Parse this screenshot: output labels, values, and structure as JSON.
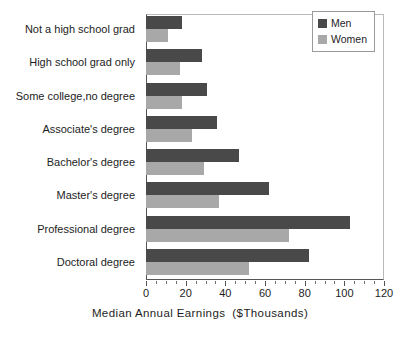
{
  "chart_data": {
    "type": "bar",
    "orientation": "horizontal",
    "title": "",
    "xlabel": "Median Annual Earnings   ($Thousands)",
    "ylabel": "",
    "xlim": [
      0,
      120
    ],
    "xticks": [
      0,
      20,
      40,
      60,
      80,
      100,
      120
    ],
    "xtick_labels": [
      "0",
      "20",
      "40",
      "60",
      "80",
      "100",
      "120"
    ],
    "minor_tick_step": 5,
    "grid": false,
    "legend_position": "top-right",
    "categories": [
      "Not a high school grad",
      "High school grad only",
      "Some college,no degree",
      "Associate's degree",
      "Bachelor's degree",
      "Master's degree",
      "Professional degree",
      "Doctoral degree"
    ],
    "series": [
      {
        "name": "Men",
        "color": "#494949",
        "values": [
          18,
          28,
          31,
          36,
          47,
          62,
          103,
          82
        ]
      },
      {
        "name": "Women",
        "color": "#a8a8a8",
        "values": [
          11,
          17,
          18,
          23,
          29,
          37,
          72,
          52
        ]
      }
    ]
  },
  "axis": {
    "xlabel_main": "Median Annual Earnings",
    "xlabel_unit": "($Thousands)"
  },
  "legend": {
    "entries": [
      {
        "label": "Men",
        "swatch": "men"
      },
      {
        "label": "Women",
        "swatch": "women"
      }
    ]
  }
}
